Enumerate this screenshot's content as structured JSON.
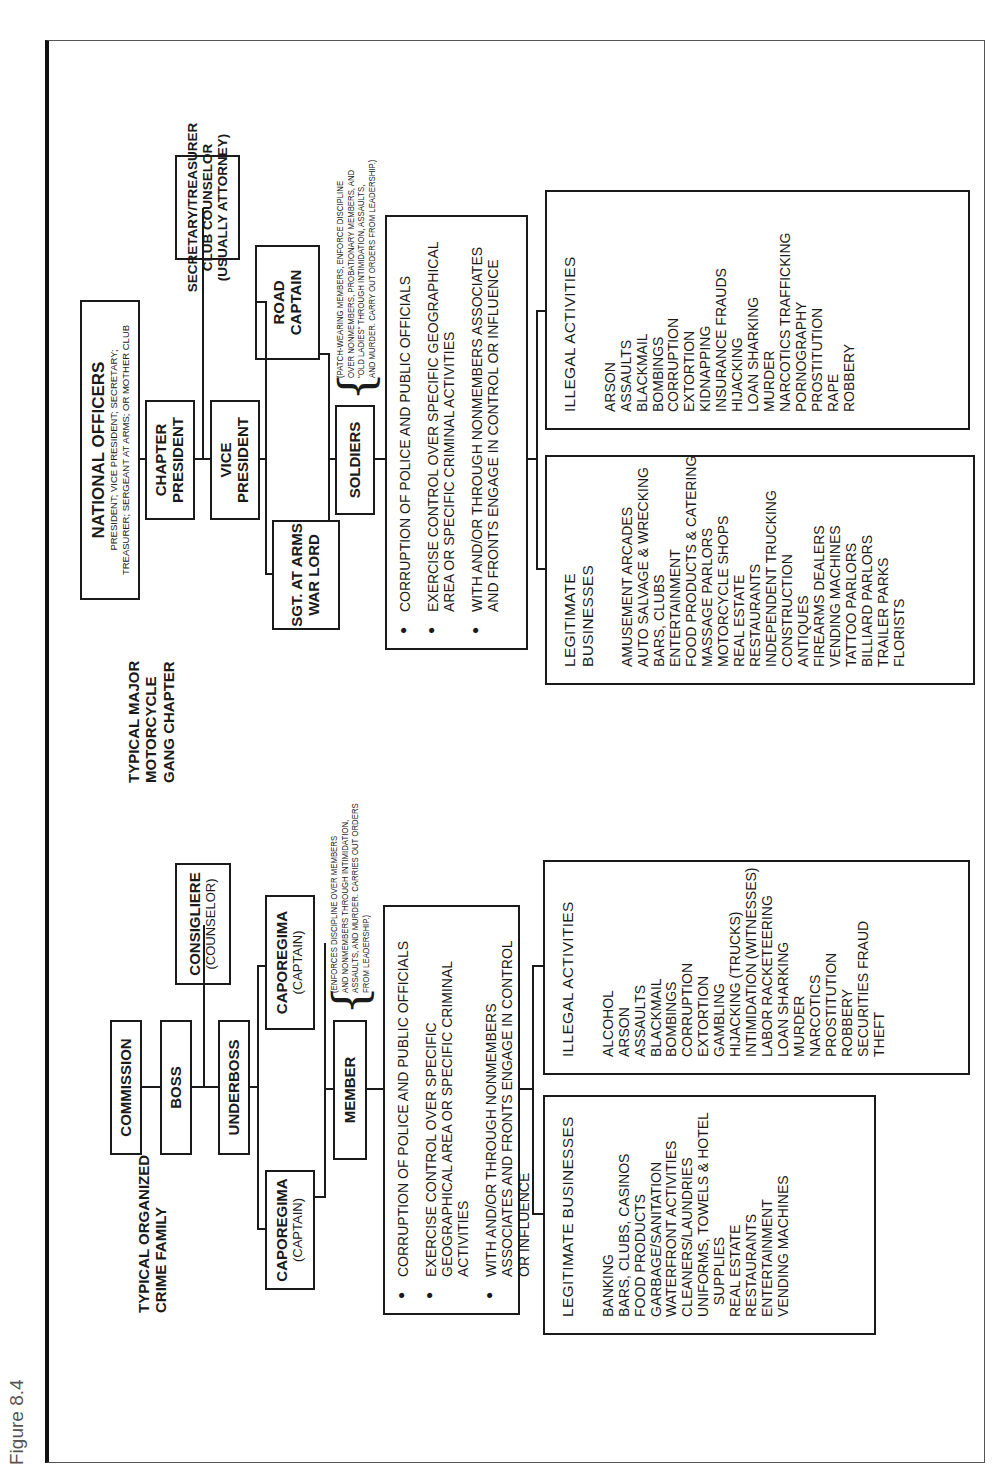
{
  "figure_label": "Figure 8.4",
  "crime_family": {
    "title": "TYPICAL ORGANIZED\nCRIME FAMILY",
    "commission": "COMMISSION",
    "boss": "BOSS",
    "underboss": "UNDERBOSS",
    "consigliere": {
      "label": "CONSIGLIERE",
      "sub": "(COUNSELOR)"
    },
    "caporegima_left": {
      "label": "CAPOREGIMA",
      "sub": "(CAPTAIN)"
    },
    "caporegima_right": {
      "label": "CAPOREGIMA",
      "sub": "(CAPTAIN)"
    },
    "member": "MEMBER",
    "member_note": [
      "(ENFORCES DISCIPLINE OVER MEMBERS",
      "AND NONMEMBERS THROUGH INTIMIDATION,",
      "ASSAULTS, AND MURDER. CARRIES OUT ORDERS",
      "FROM LEADERSHIP.)"
    ],
    "bullets": [
      "CORRUPTION OF POLICE AND PUBLIC OFFICIALS",
      "EXERCISE CONTROL OVER SPECIFIC GEOGRAPHICAL AREA OR SPECIFIC CRIMINAL ACTIVITIES",
      "WITH AND/OR THROUGH NONMEMBERS ASSOCIATES AND FRONTS ENGAGE IN CONTROL OR INFLUENCE"
    ],
    "legitimate": {
      "heading": "LEGITIMATE BUSINESSES",
      "items": [
        "BANKING",
        "BARS, CLUBS, CASINOS",
        "FOOD PRODUCTS",
        "GARBAGE/SANITATION",
        "WATERFRONT ACTIVITIES",
        "CLEANERS/LAUNDRIES",
        "UNIFORMS, TOWELS & HOTEL",
        "   SUPPLIES",
        "REAL ESTATE",
        "RESTAURANTS",
        "ENTERTAINMENT",
        "VENDING MACHINES"
      ]
    },
    "illegal": {
      "heading": "ILLEGAL ACTIVITIES",
      "items": [
        "ALCOHOL",
        "ARSON",
        "ASSAULTS",
        "BLACKMAIL",
        "BOMBINGS",
        "CORRUPTION",
        "EXTORTION",
        "GAMBLING",
        "HIJACKING (TRUCKS)",
        "INTIMIDATION (WITNESSES)",
        "LABOR RACKETEERING",
        "LOAN SHARKING",
        "MURDER",
        "NARCOTICS",
        "PROSTITUTION",
        "ROBBERY",
        "SECURITIES FRAUD",
        "THEFT"
      ]
    }
  },
  "motorcycle_gang": {
    "title": "TYPICAL MAJOR\nMOTORCYCLE\nGANG CHAPTER",
    "national_officers": {
      "label": "NATIONAL OFFICERS",
      "sub": [
        "PRESIDENT; VICE PRESIDENT; SECRETARY;",
        "TREASURER; SERGEANT AT ARMS; OR MOTHER CLUB"
      ]
    },
    "chapter_president": "CHAPTER\nPRESIDENT",
    "secretary": "SECRETARY/TREASURER\nCLUB COUNSELOR\n(USUALLY ATTORNEY)",
    "vice_president": "VICE\nPRESIDENT",
    "road_captain": "ROAD\nCAPTAIN",
    "sgt_at_arms": "SGT. AT ARMS\nWAR LORD",
    "soldiers": "SOLDIERS",
    "soldiers_note": [
      "(PATCH-WEARING MEMBERS, ENFORCE DISCIPLINE",
      "OVER NONMEMBERS, PROBATIONARY MEMBERS, AND",
      "\"OLD LADIES\" THROUGH INTIMIDATION, ASSAULTS,",
      "AND MURDER. CARRY OUT ORDERS FROM LEADERSHIP.)"
    ],
    "bullets": [
      "CORRUPTION OF POLICE AND PUBLIC OFFICIALS",
      "EXERCISE CONTROL OVER SPECIFIC GEOGRAPHICAL AREA OR SPECIFIC CRIMINAL ACTIVITIES",
      "WITH AND/OR THROUGH NONMEMBERS ASSOCIATES AND FRONTS ENGAGE IN CONTROL OR INFLUENCE"
    ],
    "legitimate": {
      "heading": "LEGITIMATE BUSINESSES",
      "items": [
        "AMUSEMENT ARCADES",
        "AUTO SALVAGE & WRECKING",
        "BARS, CLUBS",
        "ENTERTAINMENT",
        "FOOD PRODUCTS & CATERING",
        "MASSAGE PARLORS",
        "MOTORCYCLE SHOPS",
        "REAL ESTATE",
        "RESTAURANTS",
        "INDEPENDENT TRUCKING",
        "CONSTRUCTION",
        "ANTIQUES",
        "FIREARMS DEALERS",
        "VENDING MACHINES",
        "TATTOO PARLORS",
        "BILLIARD PARLORS",
        "TRAILER PARKS",
        "FLORISTS"
      ]
    },
    "illegal": {
      "heading": "ILLEGAL ACTIVITIES",
      "items": [
        "ARSON",
        "ASSAULTS",
        "BLACKMAIL",
        "BOMBINGS",
        "CORRUPTION",
        "EXTORTION",
        "KIDNAPPING",
        "INSURANCE FRAUDS",
        "HIJACKING",
        "LOAN SHARKING",
        "MURDER",
        "NARCOTICS TRAFFICKING",
        "PORNOGRAPHY",
        "PROSTITUTION",
        "RAPE",
        "ROBBERY"
      ]
    }
  }
}
